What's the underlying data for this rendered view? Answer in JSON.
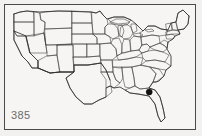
{
  "figure": {
    "number_label": "385",
    "caption_position": "bottom-left",
    "frame_color": "#4a4a48",
    "background_color": "#f6f5f3",
    "outline_color": "#3c3c3a",
    "marker_color": "#111111"
  },
  "map": {
    "title": "",
    "region": "Contiguous United States",
    "projection_style": "outline state map",
    "state_borders_visible": "true",
    "great_lakes_visible": "true"
  },
  "markers": {
    "count": "1",
    "shape": "filled-circle",
    "radius_px": "3.1",
    "items": [
      {
        "label": "",
        "state": "Georgia",
        "x": 149.2,
        "y": 92.0
      }
    ]
  },
  "legend": {
    "visible": "false",
    "entries": []
  },
  "chart_data": {
    "type": "map",
    "title": "385",
    "subtitle": "",
    "xlabel": "",
    "ylabel": "",
    "categories": [
      "Georgia"
    ],
    "values": [
      1
    ],
    "series": [
      {
        "name": "locality records",
        "values": [
          1
        ]
      }
    ],
    "points": [
      {
        "state": "Georgia",
        "px_x": 149.2,
        "px_y": 92.0,
        "value": 1
      }
    ],
    "legend_position": "none",
    "grid": "off"
  }
}
